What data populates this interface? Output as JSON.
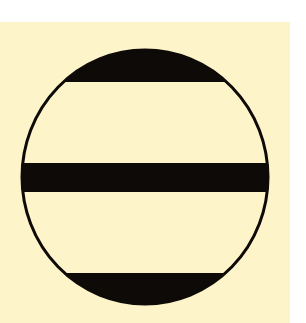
{
  "figure": {
    "colors": {
      "page_background": "#ffffff",
      "panel_background": "#fdf5c9",
      "ink": "#0d0a08",
      "circle_fill": "#fdf5c9"
    },
    "panel": {
      "x": 0,
      "y": 22,
      "width": 290,
      "height": 301
    },
    "circle": {
      "cx": 145,
      "cy": 177,
      "rx": 123,
      "ry": 127,
      "stroke_width": 3
    },
    "bands": [
      {
        "name": "top-cap",
        "y_start": 50,
        "y_end": 82
      },
      {
        "name": "middle-bar",
        "y_start": 163,
        "y_end": 192
      },
      {
        "name": "bottom-cap",
        "y_start": 273,
        "y_end": 304
      }
    ]
  }
}
